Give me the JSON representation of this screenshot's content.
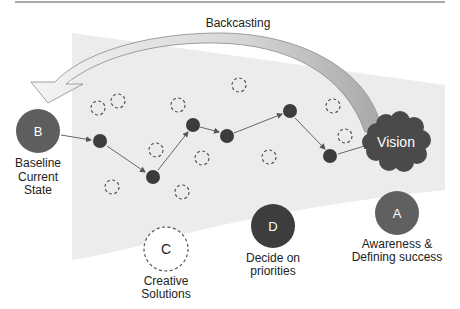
{
  "title": "Backcasting",
  "colors": {
    "region": "#ececec",
    "node": "#3c3c3c",
    "circle_b": "#5e5e5e",
    "circle_d": "#3d3d3d",
    "circle_a": "#606060",
    "vision": "#4a4a4a",
    "arrow_fill": "#bdbdbd",
    "dashed": "#555555",
    "rule": "#555555"
  },
  "nodes": {
    "baseline": {
      "letter": "B",
      "lines": [
        "Baseline",
        "Current",
        "State"
      ]
    },
    "vision": {
      "label": "Vision"
    },
    "awareness": {
      "letter": "A",
      "lines": [
        "Awareness &",
        "Defining success"
      ]
    },
    "decide": {
      "letter": "D",
      "lines": [
        "Decide on",
        "priorities"
      ]
    },
    "creative": {
      "letter": "C",
      "lines": [
        "Creative",
        "Solutions"
      ]
    }
  }
}
